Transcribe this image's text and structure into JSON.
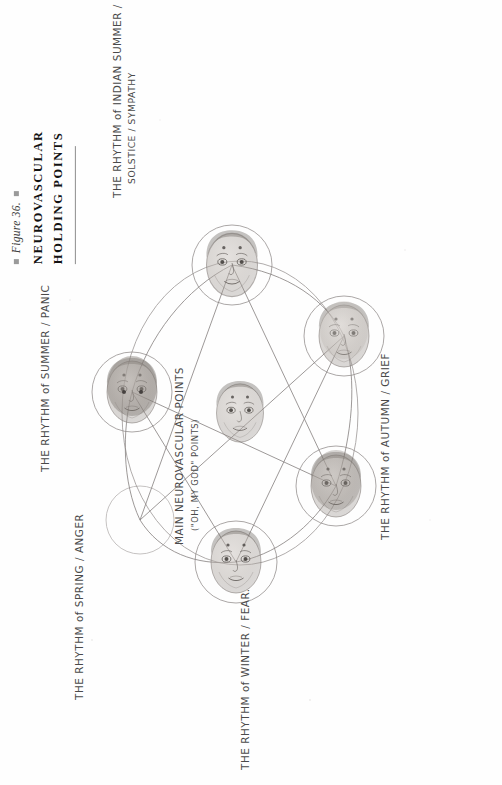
{
  "figure": {
    "caption_number": "Figure 36.",
    "title_line1": "NEUROVASCULAR",
    "title_line2": "HOLDING POINTS",
    "bullet_icon": "square-bullet-icon"
  },
  "diagram": {
    "type": "hand-drawn circular diagram of seven faces connected by a star pattern",
    "center_node": {
      "id": "main",
      "label_line1": "MAIN NEUROVASCULAR POINTS",
      "label_line2": "(\"OH, MY GOD\" POINTS)"
    },
    "nodes": [
      {
        "id": "indian-summer",
        "label_line1": "THE RHYTHM of INDIAN SUMMER /",
        "label_line2": "SOLSTICE / SYMPATHY",
        "season": "Indian Summer",
        "emotion": "Sympathy"
      },
      {
        "id": "summer",
        "label_line1": "THE RHYTHM of SUMMER / PANIC",
        "label_line2": "",
        "season": "Summer",
        "emotion": "Panic"
      },
      {
        "id": "spring",
        "label_line1": "THE RHYTHM of SPRING / ANGER",
        "label_line2": "",
        "season": "Spring",
        "emotion": "Anger"
      },
      {
        "id": "winter",
        "label_line1": "THE RHYTHM of WINTER / FEAR.",
        "label_line2": "",
        "season": "Winter",
        "emotion": "Fear"
      },
      {
        "id": "autumn",
        "label_line1": "THE RHYTHM of AUTUMN / GRIEF",
        "label_line2": "",
        "season": "Autumn",
        "emotion": "Grief"
      }
    ],
    "colors": {
      "ink": "#4a4a4a",
      "line": "#6f6f6f",
      "paper": "#fefefe",
      "title": "#121212"
    }
  }
}
